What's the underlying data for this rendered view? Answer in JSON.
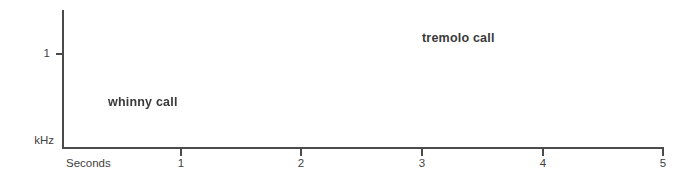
{
  "figure": {
    "type": "spectrogram",
    "background_color": "#ffffff",
    "trace_color": "#1a1a1a"
  },
  "axes": {
    "x": {
      "title": "Seconds",
      "ticks": [
        {
          "value": "1",
          "seconds": 1
        },
        {
          "value": "2",
          "seconds": 2
        },
        {
          "value": "3",
          "seconds": 3
        },
        {
          "value": "4",
          "seconds": 4
        },
        {
          "value": "5",
          "seconds": 5
        }
      ],
      "range_seconds": [
        0,
        5
      ]
    },
    "y": {
      "title": "kHz",
      "ticks": [
        {
          "value": "1",
          "kHz": 1
        }
      ],
      "range_kHz": [
        0,
        2
      ]
    }
  },
  "annotations": [
    {
      "name": "whinny-call-label",
      "text": "whinny call"
    },
    {
      "name": "tremolo-call-label",
      "text": "tremolo call"
    }
  ],
  "chart_data": {
    "type": "line",
    "title": "",
    "xlabel": "Seconds",
    "ylabel": "kHz",
    "xlim": [
      0,
      5
    ],
    "ylim": [
      0,
      2
    ],
    "grid": false,
    "legend": "none",
    "series": [
      {
        "name": "whinny call",
        "time_range_seconds": [
          0.17,
          1.57
        ],
        "frequency_range_kHz": [
          0.78,
          1.62
        ],
        "description": "arched frequency-modulated sweep rising then falling, with oscillation depth increasing toward the end",
        "x": [
          0.17,
          0.22,
          0.27,
          0.32,
          0.37,
          0.42,
          0.47,
          0.52,
          0.57,
          0.62,
          0.67,
          0.72,
          0.77,
          0.82,
          0.87,
          0.92,
          0.97,
          1.02,
          1.07,
          1.12,
          1.17,
          1.22,
          1.27,
          1.32,
          1.37,
          1.42,
          1.47,
          1.52,
          1.57
        ],
        "values": [
          0.93,
          1.1,
          1.24,
          1.34,
          1.42,
          1.47,
          1.5,
          1.53,
          1.55,
          1.56,
          1.56,
          1.55,
          1.53,
          1.51,
          1.48,
          1.45,
          1.41,
          1.37,
          1.33,
          1.28,
          1.23,
          1.18,
          1.12,
          1.07,
          1.02,
          0.97,
          0.93,
          0.88,
          0.84
        ],
        "modulation_depth_kHz": [
          0.05,
          0.06,
          0.06,
          0.07,
          0.08,
          0.09,
          0.1,
          0.11,
          0.12,
          0.13,
          0.14,
          0.15,
          0.16,
          0.17,
          0.18,
          0.19,
          0.2,
          0.21,
          0.22,
          0.23,
          0.24,
          0.25,
          0.26,
          0.27,
          0.28,
          0.29,
          0.3,
          0.31,
          0.32
        ],
        "modulation_rate_hz": 17
      },
      {
        "name": "tremolo call",
        "time_range_seconds": [
          2.13,
          4.94
        ],
        "frequency_range_kHz": [
          0.38,
          0.6
        ],
        "description": "long series of short repeated pulses at near-constant frequency, pulse rate increasing slightly toward the end",
        "pulse_count": 48,
        "center_frequency_kHz": 0.49,
        "pulse_rate_start_hz": 15,
        "pulse_rate_end_hz": 20
      }
    ]
  }
}
